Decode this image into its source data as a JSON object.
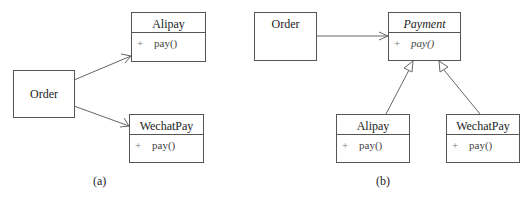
{
  "diagram_a": {
    "caption": "(a)",
    "order": {
      "name": "Order"
    },
    "alipay": {
      "name": "Alipay",
      "visibility": "+",
      "method": "pay()"
    },
    "wechatpay": {
      "name": "WechatPay",
      "visibility": "+",
      "method": "pay()"
    },
    "relations": [
      {
        "from": "Order",
        "to": "Alipay",
        "type": "association"
      },
      {
        "from": "Order",
        "to": "WechatPay",
        "type": "association"
      }
    ]
  },
  "diagram_b": {
    "caption": "(b)",
    "order": {
      "name": "Order"
    },
    "payment": {
      "name": "Payment",
      "abstract": true,
      "visibility": "+",
      "method": "pay()"
    },
    "alipay": {
      "name": "Alipay",
      "visibility": "+",
      "method": "pay()"
    },
    "wechatpay": {
      "name": "WechatPay",
      "visibility": "+",
      "method": "pay()"
    },
    "relations": [
      {
        "from": "Order",
        "to": "Payment",
        "type": "association"
      },
      {
        "from": "Alipay",
        "to": "Payment",
        "type": "generalization"
      },
      {
        "from": "WechatPay",
        "to": "Payment",
        "type": "generalization"
      }
    ]
  },
  "colors": {
    "line": "#555555",
    "text": "#222222",
    "member_text": "#444444"
  }
}
